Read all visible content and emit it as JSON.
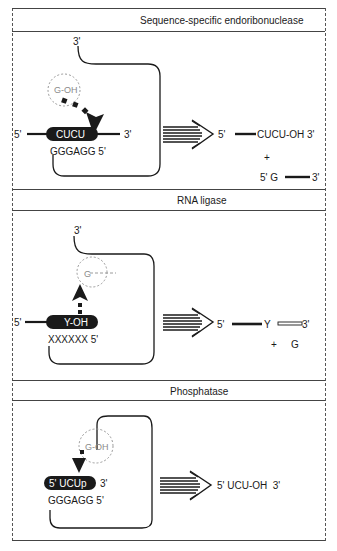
{
  "panels": [
    {
      "title": "Sequence-specific endoribonuclease",
      "substrate": {
        "loop_3prime": "3'",
        "nucleophile": "G-OH",
        "strand_5prime": "5'",
        "highlight": "CUCU",
        "strand_3prime": "3'",
        "guide": "GGGAGG 5'"
      },
      "products": {
        "p1_5prime": "5'",
        "p1_seq": "CUCU-OH 3'",
        "plus": "+",
        "p2_5prime": "5' G",
        "p2_3prime": "3'"
      }
    },
    {
      "title": "RNA ligase",
      "substrate": {
        "loop_3prime": "3'",
        "nucleophile": "G",
        "strand_5prime": "5'",
        "highlight": "Y-OH",
        "guide": "XXXXXX 5'"
      },
      "products": {
        "p1_5prime": "5'",
        "p1_junction": "Y",
        "p1_3prime": "3'",
        "plus": "+",
        "released": "G"
      }
    },
    {
      "title": "Phosphatase",
      "substrate": {
        "nucleophile": "G-OH",
        "highlight": "5' UCUp",
        "strand_3prime": "3'",
        "guide": "GGGAGG 5'"
      },
      "products": {
        "p1_seq": "5' UCU-OH  3'"
      }
    }
  ],
  "colors": {
    "ink": "#1a1a1a",
    "border": "#444444",
    "halo": "#9a9a9a"
  },
  "icons": {
    "reaction_arrow": "striped-right-arrow",
    "attack_arrow": "dashed-arrow"
  }
}
